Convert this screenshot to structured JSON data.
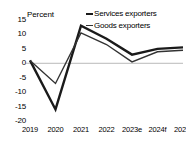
{
  "chart": {
    "unit_label": "Percent",
    "legend": [
      {
        "name": "Services exporters",
        "marker": "line-marker-icon"
      },
      {
        "name": "Goods exporters",
        "marker": "line-marker-icon"
      }
    ]
  },
  "chart_data": {
    "type": "line",
    "title": "",
    "xlabel": "",
    "ylabel": "Percent",
    "categories": [
      "2019",
      "2020",
      "2021",
      "2022",
      "2023e",
      "2024f",
      "2025f"
    ],
    "series": [
      {
        "name": "Services exporters",
        "values": [
          1,
          -16,
          13,
          8.5,
          3,
          5,
          5.5
        ],
        "color": "#1a1a1a",
        "width": 2.4
      },
      {
        "name": "Goods exporters",
        "values": [
          1,
          -7,
          10.5,
          6.5,
          0.5,
          4,
          4.5
        ],
        "color": "#333333",
        "width": 1.4
      }
    ],
    "yticks": [
      15,
      10,
      5,
      0,
      -5,
      -10,
      -15,
      -20
    ],
    "ylim": [
      -20,
      15
    ],
    "grid": false,
    "zero_line": true,
    "legend_position": "top-right"
  }
}
